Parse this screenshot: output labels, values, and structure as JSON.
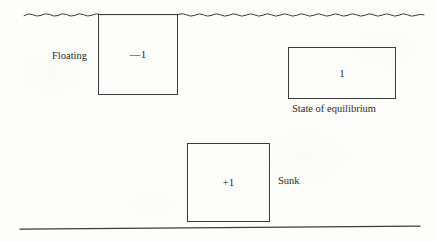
{
  "figure": {
    "background_color": "#fdfdfc",
    "stroke_color": "#3c3c3c",
    "water_surface": {
      "icon": "wavy-water-line-icon",
      "x_start": 24,
      "x_end": 424,
      "y_center": 15,
      "amplitude": 2.6,
      "wavelength": 17
    },
    "seabed": {
      "icon": "seabed-line-icon",
      "x_start": 20,
      "x_end": 420,
      "y_start": 229,
      "y_end": 226
    },
    "boxes": [
      {
        "name": "floating",
        "value": "—1",
        "caption": "Floating",
        "caption_position": "left"
      },
      {
        "name": "equilibrium",
        "value": "1",
        "caption": "State of equilibrium",
        "caption_position": "below"
      },
      {
        "name": "sunk",
        "value": "+1",
        "caption": "Sunk",
        "caption_position": "right"
      }
    ]
  }
}
